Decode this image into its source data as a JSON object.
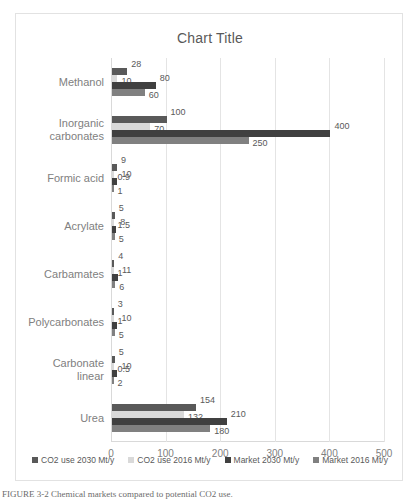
{
  "chart_data": {
    "type": "bar",
    "orientation": "horizontal",
    "title": "Chart Title",
    "xlabel": "",
    "ylabel": "",
    "xlim": [
      0,
      500
    ],
    "xticks": [
      "0",
      "100",
      "200",
      "300",
      "400",
      "500"
    ],
    "grid": true,
    "legend_position": "bottom",
    "categories": [
      "Methanol",
      "Inorganic\ncarbonates",
      "Formic acid",
      "Acrylate",
      "Carbamates",
      "Polycarbonates",
      "Carbonate\nlinear",
      "Urea"
    ],
    "series": [
      {
        "name": "CO2 use 2030 Mt/y",
        "color": "#595959",
        "values": [
          28,
          100,
          9,
          5,
          4,
          3,
          5,
          154
        ],
        "labels": [
          "28",
          "100",
          "9",
          "5",
          "4",
          "3",
          "5",
          "154"
        ]
      },
      {
        "name": "CO2 use 2016 Mt/y",
        "color": "#d9d9d9",
        "values": [
          10,
          70,
          0.9,
          1.5,
          1,
          1,
          0.5,
          132
        ],
        "labels": [
          "10",
          "70",
          "0.9",
          "1.5",
          "1",
          "1",
          "0.5",
          "132"
        ]
      },
      {
        "name": "Market 2030 Mt/y",
        "color": "#404040",
        "values": [
          80,
          400,
          10,
          8,
          11,
          10,
          10,
          210
        ],
        "labels": [
          "80",
          "400",
          "10",
          "8",
          "11",
          "10",
          "10",
          "210"
        ]
      },
      {
        "name": "Market 2016 Mt/y",
        "color": "#808080",
        "values": [
          60,
          250,
          1,
          5,
          6,
          5,
          2,
          180
        ],
        "labels": [
          "60",
          "250",
          "1",
          "5",
          "6",
          "5",
          "2",
          "180"
        ]
      }
    ]
  },
  "caption": {
    "text": "FIGURE 3-2  Chemical markets compared to potential CO2 use."
  }
}
